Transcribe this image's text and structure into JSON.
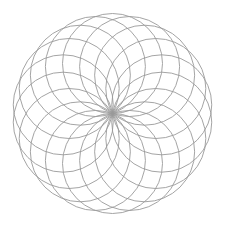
{
  "diagram": {
    "type": "rosette-of-circles",
    "background_color": "#ffffff",
    "stroke_color": "#9a9a9a",
    "center": {
      "x": 112.5,
      "y": 113.5
    },
    "circle_radius": 50,
    "circle_count": 18,
    "angle_step_deg": 20,
    "angle_offset_deg": 10,
    "outer_envelope_radius": 100
  }
}
